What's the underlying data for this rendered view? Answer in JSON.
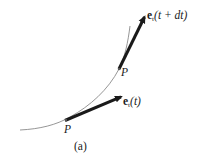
{
  "figure": {
    "caption": "(a)",
    "colors": {
      "curve": "#8a8a8a",
      "arrow": "#1a1a1a",
      "text": "#1a1a1a",
      "background": "#ffffff"
    },
    "curve": {
      "description": "smooth space curve",
      "points": [
        [
          20,
          130
        ],
        [
          66,
          120
        ],
        [
          119,
          69
        ],
        [
          129,
          28
        ]
      ]
    },
    "points": [
      {
        "label": "P",
        "x": 66,
        "y": 120
      },
      {
        "label": "P",
        "x": 119,
        "y": 69
      }
    ],
    "vectors": [
      {
        "name": "e_t(t)",
        "symbol": "e",
        "subscript": "t",
        "argument": "(t)",
        "from": [
          66,
          120
        ],
        "to": [
          123,
          96
        ]
      },
      {
        "name": "e_t(t + dt)",
        "symbol": "e",
        "subscript": "t",
        "argument": "(t + dt)",
        "from": [
          119,
          69
        ],
        "to": [
          146,
          14
        ]
      }
    ]
  }
}
